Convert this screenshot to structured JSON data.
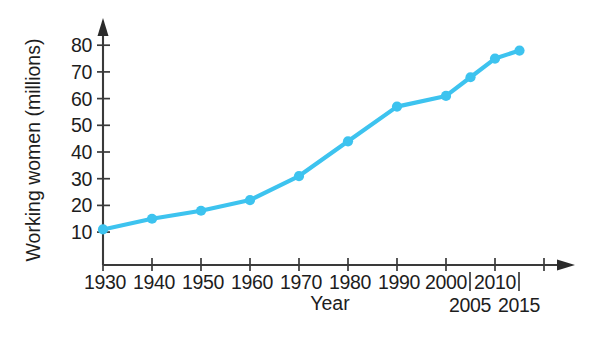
{
  "chart_data": {
    "type": "line",
    "title": "",
    "xlabel": "Year",
    "ylabel": "Working women (millions)",
    "x": [
      1930,
      1940,
      1950,
      1960,
      1970,
      1980,
      1990,
      2000,
      2005,
      2010,
      2015
    ],
    "values": [
      11,
      15,
      18,
      22,
      31,
      44,
      57,
      61,
      68,
      75,
      78
    ],
    "series": [
      {
        "name": "Working women",
        "values": [
          11,
          15,
          18,
          22,
          31,
          44,
          57,
          61,
          68,
          75,
          78
        ]
      }
    ],
    "x_tick_labels": [
      "1930",
      "1940",
      "1950",
      "1960",
      "1970",
      "1980",
      "1990",
      "2000",
      "2010"
    ],
    "x_tick_labels_lower": [
      "2005",
      "2015"
    ],
    "y_tick_labels": [
      "10",
      "20",
      "30",
      "40",
      "50",
      "60",
      "70",
      "80"
    ],
    "y_ticks": [
      10,
      20,
      30,
      40,
      50,
      60,
      70,
      80
    ],
    "ylim": [
      0,
      85
    ],
    "grid": false,
    "legend": "none",
    "line_color": "#3dc3ef",
    "marker_color": "#3dc3ef",
    "axis_color": "#3a3a3a",
    "background_color": "#ffffff"
  },
  "axis": {
    "y_title": "Working women (millions)",
    "x_title": "Year"
  },
  "y_labels": {
    "t10": "10",
    "t20": "20",
    "t30": "30",
    "t40": "40",
    "t50": "50",
    "t60": "60",
    "t70": "70",
    "t80": "80"
  },
  "x_labels": {
    "y1930": "1930",
    "y1940": "1940",
    "y1950": "1950",
    "y1960": "1960",
    "y1970": "1970",
    "y1980": "1980",
    "y1990": "1990",
    "y2000": "2000",
    "y2010": "2010",
    "y2005": "2005",
    "y2015": "2015"
  }
}
